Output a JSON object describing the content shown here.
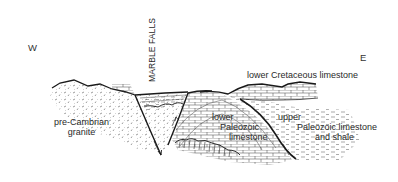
{
  "figure": {
    "type": "geologic cross-section",
    "orientation": {
      "west": "W",
      "east": "E"
    },
    "locality_label": "MARBLE FALLS",
    "units": [
      {
        "id": "granite",
        "label_lines": [
          "pre-Cambrian",
          "granite"
        ],
        "pattern": "dashed-dots"
      },
      {
        "id": "lower-paleozoic",
        "label_lines": [
          "lower",
          "Paleozoic",
          "limestone"
        ],
        "pattern": "brick"
      },
      {
        "id": "upper-paleozoic",
        "label_lines": [
          "upper",
          "Paleozoic limestone",
          "and shale"
        ],
        "pattern": "dashes"
      },
      {
        "id": "cretaceous",
        "label_lines": [
          "lower Cretaceous limestone"
        ],
        "pattern": "brick"
      }
    ],
    "features": [
      "normal faults with arrows",
      "graben wedge",
      "unconformity with vertical dikes"
    ],
    "colors": {
      "ink": "#1a1a1a",
      "text": "#2a2a2a",
      "background": "#ffffff"
    }
  }
}
